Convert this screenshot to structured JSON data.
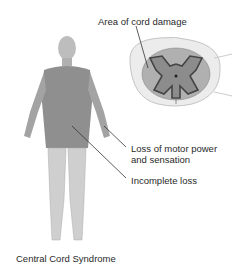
{
  "figure": {
    "caption": "Central Cord Syndrome",
    "labels": {
      "cord_damage": "Area of cord damage",
      "motor_loss_line1": "Loss of motor power",
      "motor_loss_line2": "and sensation",
      "incomplete_loss": "Incomplete loss"
    },
    "colors": {
      "affected_region": "#8a8a8a",
      "body": "#c8c8c8",
      "cord_outline": "#555555",
      "gray_matter": "#9a9a9a",
      "white_matter": "#e4e4e4"
    }
  }
}
